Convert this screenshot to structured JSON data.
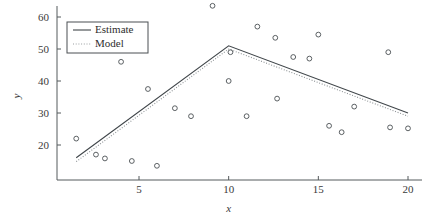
{
  "chart_data": {
    "type": "scatter",
    "title": "",
    "xlabel": "x",
    "ylabel": "y",
    "xlim": [
      1,
      20.6
    ],
    "ylim": [
      13,
      65
    ],
    "xticks": [
      5,
      10,
      15,
      20
    ],
    "xticklabels": [
      "5",
      "10",
      "15",
      "20"
    ],
    "yticks": [
      20,
      30,
      40,
      50,
      60
    ],
    "yticklabels": [
      "20",
      "30",
      "40",
      "50",
      "60"
    ],
    "grid": false,
    "legend_position": "top-left",
    "legend": [
      "Estimate",
      "Model"
    ],
    "marker": "o",
    "points": [
      {
        "x": 1.5,
        "y": 22.0
      },
      {
        "x": 2.6,
        "y": 17.0
      },
      {
        "x": 3.1,
        "y": 15.8
      },
      {
        "x": 4.0,
        "y": 46.0
      },
      {
        "x": 4.6,
        "y": 15.0
      },
      {
        "x": 5.5,
        "y": 37.5
      },
      {
        "x": 6.0,
        "y": 13.5
      },
      {
        "x": 7.0,
        "y": 31.5
      },
      {
        "x": 7.9,
        "y": 29.0
      },
      {
        "x": 9.1,
        "y": 63.5
      },
      {
        "x": 10.0,
        "y": 40.0
      },
      {
        "x": 10.1,
        "y": 49.0
      },
      {
        "x": 11.0,
        "y": 29.0
      },
      {
        "x": 11.6,
        "y": 57.0
      },
      {
        "x": 12.6,
        "y": 53.5
      },
      {
        "x": 12.7,
        "y": 34.5
      },
      {
        "x": 13.6,
        "y": 47.5
      },
      {
        "x": 14.5,
        "y": 47.0
      },
      {
        "x": 15.0,
        "y": 54.5
      },
      {
        "x": 15.6,
        "y": 26.0
      },
      {
        "x": 16.3,
        "y": 24.0
      },
      {
        "x": 17.0,
        "y": 32.0
      },
      {
        "x": 18.9,
        "y": 49.0
      },
      {
        "x": 19.0,
        "y": 25.5
      },
      {
        "x": 20.0,
        "y": 25.2
      }
    ],
    "series": [
      {
        "name": "Estimate",
        "style": "solid",
        "x": [
          1.5,
          10.0,
          20.0
        ],
        "y": [
          16.0,
          51.0,
          30.0
        ]
      },
      {
        "name": "Model",
        "style": "dotted",
        "x": [
          1.5,
          10.0,
          20.0
        ],
        "y": [
          14.8,
          50.0,
          29.0
        ]
      }
    ]
  }
}
